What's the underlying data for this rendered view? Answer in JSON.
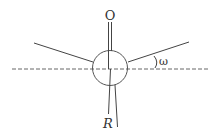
{
  "diagram": {
    "type": "newman-projection",
    "labels": {
      "top_atom": "O",
      "bottom_group": "R",
      "angle": "ω"
    },
    "colors": {
      "line": "#444444",
      "dash": "#666666",
      "background": "#ffffff"
    }
  }
}
